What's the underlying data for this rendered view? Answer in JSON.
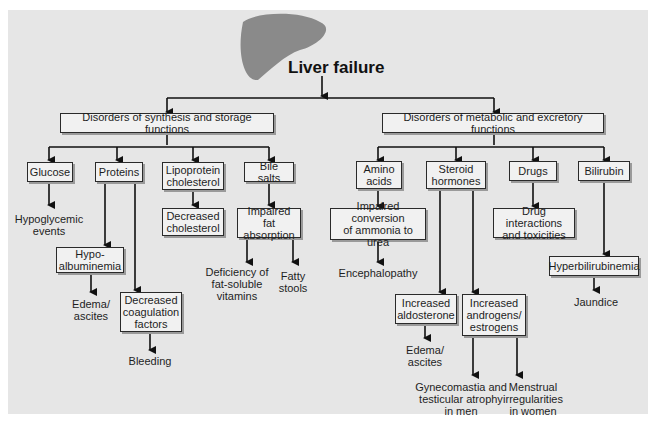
{
  "diagram": {
    "title": "Liver failure",
    "icon": "liver-illustration",
    "colors": {
      "background": "#e6e6e6",
      "box_fill": "#f1f1f1",
      "box_border": "#2a2a2a",
      "line": "#111111",
      "liver": "#8a8a8a"
    },
    "level1": [
      {
        "id": "synthesis",
        "label": "Disorders of synthesis and storage functions"
      },
      {
        "id": "metabolic",
        "label": "Disorders of metabolic and excretory functions"
      }
    ],
    "synthesis_children": {
      "glucose": {
        "label": "Glucose",
        "outcome": "Hypoglycemic\nevents"
      },
      "proteins": {
        "label": "Proteins",
        "hypoalbuminemia": {
          "label": "Hypo-\nalbuminemia",
          "outcome": "Edema/\nascites"
        },
        "coagulation": {
          "label": "Decreased\ncoagulation\nfactors",
          "outcome": "Bleeding"
        }
      },
      "lipoprotein": {
        "label": "Lipoprotein\ncholesterol",
        "result": "Decreased\ncholesterol"
      },
      "bile_salts": {
        "label": "Bile salts",
        "result": "Impaired fat\nabsorption",
        "outcomes": [
          "Deficiency of\nfat-soluble\nvitamins",
          "Fatty\nstools"
        ]
      }
    },
    "metabolic_children": {
      "amino_acids": {
        "label": "Amino\nacids",
        "result": "Impaired conversion\nof ammonia to urea",
        "outcome": "Encephalopathy"
      },
      "steroid": {
        "label": "Steroid\nhormones",
        "aldosterone": {
          "label": "Increased\naldosterone",
          "outcome": "Edema/\nascites"
        },
        "androgens": {
          "label": "Increased\nandrogens/\nestrogens",
          "outcomes": [
            "Gynecomastia and\ntesticular atrophy\nin men",
            "Menstrual\nirregularities\nin women"
          ]
        }
      },
      "drugs": {
        "label": "Drugs",
        "result": "Drug interactions\nand toxicities"
      },
      "bilirubin": {
        "label": "Bilirubin",
        "result": "Hyperbilirubinemia",
        "outcome": "Jaundice"
      }
    }
  }
}
